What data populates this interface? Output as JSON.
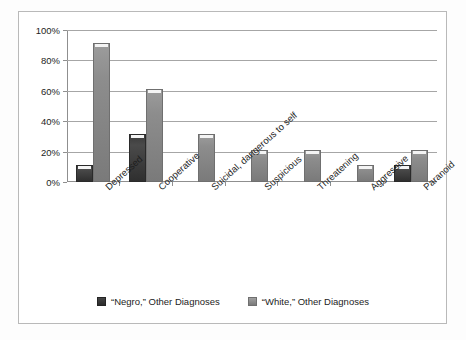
{
  "chart_data": {
    "type": "bar",
    "title": "",
    "xlabel": "",
    "ylabel": "",
    "ylim": [
      0,
      100
    ],
    "ytick_labels": [
      "0%",
      "20%",
      "40%",
      "60%",
      "80%",
      "100%"
    ],
    "ytick_values": [
      0,
      20,
      40,
      60,
      80,
      100
    ],
    "grid": true,
    "legend_position": "bottom",
    "categories": [
      "Depressed",
      "Cooperative",
      "Suicidal, dangerous to self",
      "Suspicious",
      "Threatening",
      "Aggressive",
      "Paranoid"
    ],
    "series": [
      {
        "name": "“Negro,” Other Diagnoses",
        "color": "#3a3a3a",
        "values": [
          10,
          30,
          0,
          0,
          0,
          0,
          10
        ]
      },
      {
        "name": "“White,” Other Diagnoses",
        "color": "#8d8d8d",
        "values": [
          90,
          60,
          30,
          20,
          20,
          10,
          20
        ]
      }
    ]
  }
}
